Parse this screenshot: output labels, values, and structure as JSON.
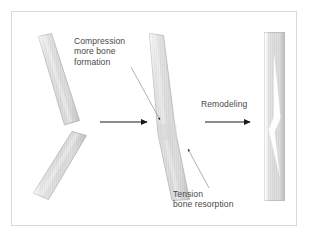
{
  "figure": {
    "title_alt": "Bone fracture healing and remodeling diagram",
    "background_color": "#ffffff",
    "frame": {
      "name": "figure-border",
      "color": "#d9d9d9",
      "x": 11,
      "y": 11,
      "width": 286,
      "height": 215
    },
    "labels": {
      "compression": "Compression\nmore bone\nformation",
      "remodeling": "Remodeling",
      "tension": "Tension\nbone resorption"
    },
    "colors": {
      "bone_fill": "#dcdcdc",
      "bone_stroke": "#b6b6b6",
      "bone_highlight": "#ffffff",
      "arrow_black": "#1a1a1a",
      "leader_gray": "#9a9a9a",
      "text": "#4a4a4a"
    },
    "panels": [
      {
        "name": "fractured-bone",
        "caption": "Displaced fracture - two angulated bone segments with a gap",
        "segments": 2
      },
      {
        "name": "healing-bone",
        "caption": "Angulated healing bone with callus - compression on concave side, tension on convex side",
        "segments": 1
      },
      {
        "name": "remodeled-bone",
        "caption": "Straight remodeled bone with medullary canal restored",
        "segments": 1
      }
    ],
    "arrows": [
      {
        "name": "process-arrow-1",
        "from": [
          100,
          122
        ],
        "to": [
          149,
          122
        ],
        "color": "#1a1a1a"
      },
      {
        "name": "process-arrow-2",
        "from": [
          205,
          122
        ],
        "to": [
          252,
          122
        ],
        "color": "#1a1a1a"
      }
    ],
    "leaders": [
      {
        "name": "compression-leader",
        "from": [
          131,
          67
        ],
        "to": [
          161,
          121
        ],
        "color": "#9a9a9a"
      },
      {
        "name": "tension-leader",
        "from": [
          209,
          188
        ],
        "to": [
          187,
          147
        ],
        "color": "#9a9a9a"
      }
    ]
  }
}
